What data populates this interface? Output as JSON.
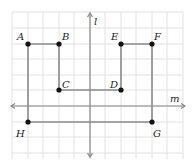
{
  "diagram": {
    "title": "",
    "grid": {
      "x0": 12,
      "y0": 12,
      "step": 15.5,
      "cols": 11,
      "rows": 10,
      "color": "#e2e2e2"
    },
    "axes": {
      "l": {
        "label": "l",
        "orientation": "vertical",
        "x": 90
      },
      "m": {
        "label": "m",
        "orientation": "horizontal",
        "y": 106
      }
    },
    "points": [
      {
        "name": "A",
        "x": 28,
        "y": 44
      },
      {
        "name": "B",
        "x": 59,
        "y": 44
      },
      {
        "name": "C",
        "x": 59,
        "y": 90
      },
      {
        "name": "D",
        "x": 121,
        "y": 90
      },
      {
        "name": "E",
        "x": 121,
        "y": 44
      },
      {
        "name": "F",
        "x": 152,
        "y": 44
      },
      {
        "name": "G",
        "x": 152,
        "y": 122
      },
      {
        "name": "H",
        "x": 28,
        "y": 122
      }
    ],
    "path": [
      "A",
      "B",
      "C",
      "D",
      "E",
      "F",
      "G",
      "H",
      "A"
    ],
    "line_color": "#8a8a8a",
    "point_color": "#111111"
  }
}
